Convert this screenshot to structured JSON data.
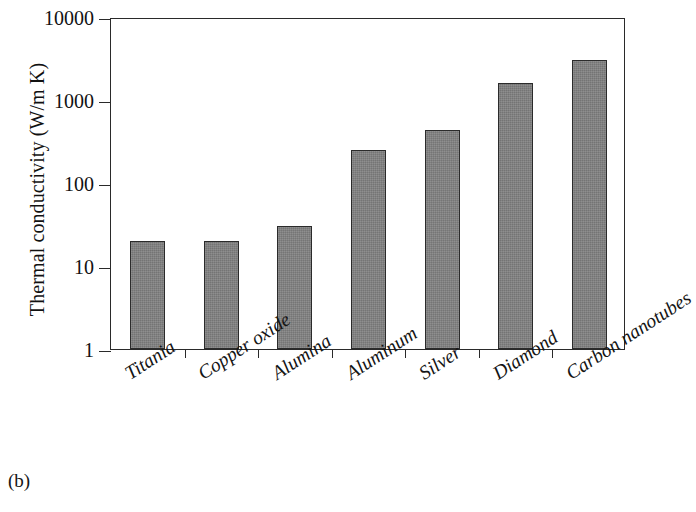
{
  "figure": {
    "caption": "(b)",
    "y_axis_title": "Thermal conductivity (W/m K)"
  },
  "chart_data": {
    "type": "bar",
    "title": "",
    "subtitle": "",
    "xlabel": "",
    "ylabel": "Thermal conductivity (W/m K)",
    "yscale": "log",
    "ylim": [
      1,
      10000
    ],
    "ytick_labels": [
      "10000",
      "1000",
      "100",
      "10",
      "1"
    ],
    "ytick_values": [
      10000,
      1000,
      100,
      10,
      1
    ],
    "grid": false,
    "legend": null,
    "bar_color": "#828282",
    "bar_edge_color": "#2b2b2b",
    "categories": [
      "Titania",
      "Copper oxide",
      "Alumina",
      "Aluminum",
      "Silver",
      "Diamond",
      "Carbon nanotubes"
    ],
    "values": [
      20,
      20,
      30,
      250,
      430,
      1600,
      3000
    ],
    "annotations": [
      "(b)"
    ]
  }
}
